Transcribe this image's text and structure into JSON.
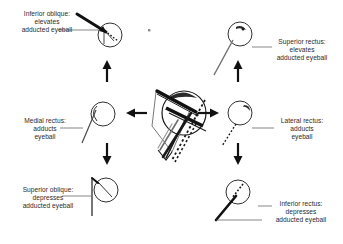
{
  "figure": {
    "background_color": "#ffffff",
    "ink_color": "#1a1a1a",
    "text_color": "#2b2b2b",
    "width": 343,
    "height": 244
  },
  "center": {
    "name": "orbit-muscle-cone-diagram",
    "description": "eyeball with extraocular muscle cone converging at orbital apex"
  },
  "labels": {
    "inferior_oblique": {
      "line1": "Inferior oblique:",
      "line2": "elevates",
      "line3": "adducted eyeball"
    },
    "superior_rectus": {
      "line1": "Superior rectus:",
      "line2": "elevates",
      "line3": "adducted eyeball"
    },
    "medial_rectus": {
      "line1": "Medial rectus:",
      "line2": "adducts",
      "line3": "eyeball"
    },
    "lateral_rectus": {
      "line1": "Lateral rectus:",
      "line2": "adducts",
      "line3": "eyeball"
    },
    "superior_oblique": {
      "line1": "Superior oblique:",
      "line2": "depresses",
      "line3": "adducted eyeball"
    },
    "inferior_rectus": {
      "line1": "Inferior rectus:",
      "line2": "depresses",
      "line3": "adducted eyeball"
    }
  },
  "arrows": [
    {
      "name": "arrow-up-left",
      "direction": "up"
    },
    {
      "name": "arrow-up-right",
      "direction": "up"
    },
    {
      "name": "arrow-left",
      "direction": "left"
    },
    {
      "name": "arrow-right",
      "direction": "right"
    },
    {
      "name": "arrow-down-left",
      "direction": "down"
    },
    {
      "name": "arrow-down-right",
      "direction": "down"
    }
  ],
  "eyeballs": [
    {
      "name": "eyeball-inferior-oblique",
      "muscle": "inferior oblique"
    },
    {
      "name": "eyeball-superior-rectus",
      "muscle": "superior rectus"
    },
    {
      "name": "eyeball-medial-rectus",
      "muscle": "medial rectus"
    },
    {
      "name": "eyeball-lateral-rectus",
      "muscle": "lateral rectus"
    },
    {
      "name": "eyeball-superior-oblique",
      "muscle": "superior oblique"
    },
    {
      "name": "eyeball-inferior-rectus",
      "muscle": "inferior rectus"
    }
  ]
}
